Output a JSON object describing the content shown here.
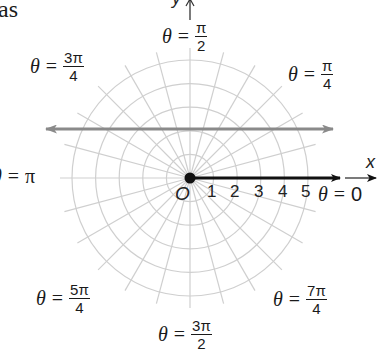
{
  "text_fragment": "as",
  "diagram": {
    "type": "polar_grid",
    "center": {
      "x": 190,
      "y": 178
    },
    "ring_count": 5,
    "ring_spacing_px": 23.6,
    "spoke_interval_degrees": 15,
    "grid_color": "#cfcfcf",
    "ray_color": "#111111",
    "line_color": "#8a8a8a",
    "tick_labels": [
      "1",
      "2",
      "3",
      "4",
      "5"
    ],
    "origin_label": "O",
    "x_axis_label": "x",
    "y_axis_label": "y",
    "angle_labels": {
      "zero": {
        "theta": "θ",
        "eq": "=",
        "value": "0"
      },
      "pi_over_4": {
        "theta": "θ",
        "eq": "=",
        "num": "π",
        "den": "4"
      },
      "pi_over_2": {
        "theta": "θ",
        "eq": "=",
        "num": "π",
        "den": "2"
      },
      "three_pi_over_4": {
        "theta": "θ",
        "eq": "=",
        "num": "3π",
        "den": "4"
      },
      "pi": {
        "theta": "θ",
        "eq": "=",
        "value": "π"
      },
      "five_pi_over_4": {
        "theta": "θ",
        "eq": "=",
        "num": "5π",
        "den": "4"
      },
      "three_pi_over_2": {
        "theta": "θ",
        "eq": "=",
        "num": "3π",
        "den": "2"
      },
      "seven_pi_over_4": {
        "theta": "θ",
        "eq": "=",
        "num": "7π",
        "den": "4"
      }
    },
    "polar_axis_ray": {
      "from_x": 190,
      "to_x": 340,
      "y": 178
    },
    "horizontal_line": {
      "y": 129,
      "from_x": 44,
      "to_x": 335,
      "double_arrow": true
    }
  }
}
